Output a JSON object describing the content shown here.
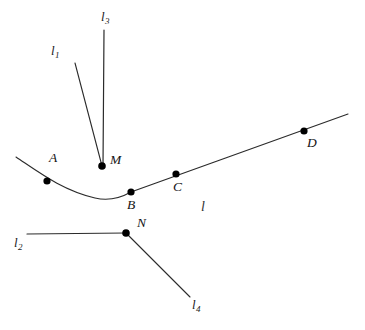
{
  "figure": {
    "type": "geometry-diagram",
    "width": 365,
    "height": 330,
    "background_color": "#ffffff",
    "stroke_color": "#2b2b2b",
    "point_color": "#000000"
  },
  "curve": {
    "name_label": "l",
    "description": "smooth curve descending from upper-left, reaching a minimum, then rising to the upper-right",
    "path": "M 16,157 C 40,173 62,190 95,198 C 112,202 124,196 131,192 L 348,114",
    "stroke_width": 1.1
  },
  "lines": [
    {
      "id": "l1",
      "label": "l",
      "subscript": "1",
      "from": [
        75,
        63
      ],
      "to": [
        102,
        166
      ],
      "label_pos": [
        51,
        44
      ],
      "stroke_width": 1.1
    },
    {
      "id": "l3",
      "label": "l",
      "subscript": "3",
      "from": [
        104,
        30
      ],
      "to": [
        103,
        166
      ],
      "label_pos": [
        101,
        10
      ],
      "stroke_width": 1.2
    },
    {
      "id": "l2",
      "label": "l",
      "subscript": "2",
      "from": [
        27,
        234
      ],
      "to": [
        126,
        233
      ],
      "label_pos": [
        14,
        236
      ],
      "stroke_width": 1.2
    },
    {
      "id": "l4",
      "label": "l",
      "subscript": "4",
      "from": [
        126,
        233
      ],
      "to": [
        190,
        297
      ],
      "label_pos": [
        192,
        298
      ],
      "stroke_width": 1.1
    }
  ],
  "points": [
    {
      "id": "A",
      "label": "A",
      "cx": 47,
      "cy": 181,
      "r": 3.6,
      "label_pos": [
        49,
        151
      ]
    },
    {
      "id": "B",
      "label": "B",
      "cx": 131,
      "cy": 192,
      "r": 3.6,
      "label_pos": [
        127,
        198
      ]
    },
    {
      "id": "C",
      "label": "C",
      "cx": 176,
      "cy": 174,
      "r": 3.6,
      "label_pos": [
        173,
        180
      ]
    },
    {
      "id": "D",
      "label": "D",
      "cx": 304,
      "cy": 131,
      "r": 3.6,
      "label_pos": [
        307,
        136
      ]
    },
    {
      "id": "M",
      "label": "M",
      "cx": 102,
      "cy": 166,
      "r": 3.8,
      "label_pos": [
        110,
        153
      ]
    },
    {
      "id": "N",
      "label": "N",
      "cx": 126,
      "cy": 233,
      "r": 3.8,
      "label_pos": [
        137,
        216
      ]
    }
  ],
  "curve_name_mark": {
    "label": "l",
    "pos": [
      201,
      200
    ]
  }
}
